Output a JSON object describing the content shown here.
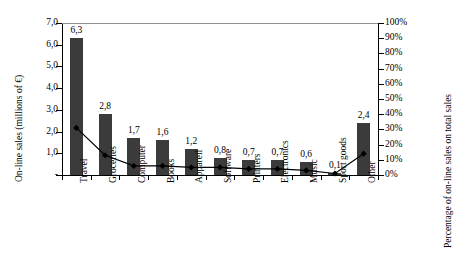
{
  "chart_data": {
    "type": "bar",
    "title": "",
    "subtitle": "",
    "xlabel": "",
    "ylabel": "On-line sales (millions of €)",
    "y2label": "Percentage of on-line sales on total sales",
    "categories": [
      "Travel",
      "Groceries",
      "Computer",
      "Books",
      "Appareil",
      "Software",
      "Printers",
      "Electronics",
      "Music",
      "Sport goods",
      "Other"
    ],
    "ylim": [
      0,
      7.0
    ],
    "y2lim": [
      0,
      100
    ],
    "grid": false,
    "legend": "none",
    "left_tick_labels": [
      "7,0",
      "6,0",
      "5,0",
      "4,0",
      "3,0",
      "2,0",
      "1,0",
      "-"
    ],
    "left_tick_values": [
      7.0,
      6.0,
      5.0,
      4.0,
      3.0,
      2.0,
      1.0,
      0
    ],
    "right_tick_labels": [
      "100%",
      "90%",
      "80%",
      "70%",
      "60%",
      "50%",
      "40%",
      "30%",
      "20%",
      "10%",
      "0%"
    ],
    "right_tick_values": [
      100,
      90,
      80,
      70,
      60,
      50,
      40,
      30,
      20,
      10,
      0
    ],
    "series": [
      {
        "name": "On-line sales (millions of €)",
        "type": "bar",
        "axis": "left",
        "color": "#3b3b3b",
        "values": [
          6.3,
          2.8,
          1.7,
          1.6,
          1.2,
          0.8,
          0.7,
          0.7,
          0.6,
          0.1,
          2.4
        ],
        "data_labels": [
          "6,3",
          "2,8",
          "1,7",
          "1,6",
          "1,2",
          "0,8",
          "0,7",
          "0,7",
          "0,6",
          "0,1",
          "2,4"
        ]
      },
      {
        "name": "Percentage of on-line sales on total sales",
        "type": "line",
        "axis": "right",
        "color": "#000000",
        "marker": "diamond",
        "values": [
          31,
          13,
          6,
          6,
          5,
          5,
          4,
          4,
          3,
          1,
          14
        ]
      }
    ]
  }
}
